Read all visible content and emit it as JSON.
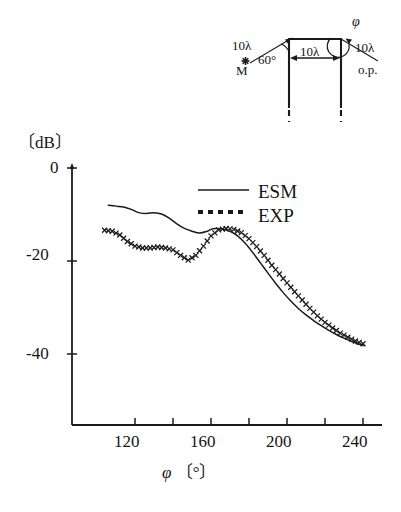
{
  "figure": {
    "y_unit_label": "〔dB〕",
    "x_axis_label_symbol": "φ",
    "x_axis_label_unit": "〔°〕"
  },
  "legend": {
    "esm_label": "ESM",
    "exp_label": "EXP"
  },
  "inset": {
    "source_distance": "10λ",
    "source_marker_label": "M",
    "incidence_angle": "60°",
    "gap_width": "10λ",
    "observation_distance": "10λ",
    "observation_point_label": "o.p.",
    "observation_angle": "φ"
  },
  "chart_data": {
    "type": "line",
    "title": "",
    "xlabel": "φ 〔°〕",
    "ylabel": "〔dB〕",
    "xlim": [
      100,
      250
    ],
    "ylim": [
      -50,
      0
    ],
    "xticks": [
      120,
      160,
      200,
      240
    ],
    "xtick_labels": [
      "120",
      "160",
      "200",
      "240"
    ],
    "xminor_ticks": [
      140,
      180,
      220
    ],
    "yticks": [
      0,
      -20,
      -40
    ],
    "ytick_labels": [
      "0",
      "-20",
      "-40"
    ],
    "grid": false,
    "legend_position": "upper right",
    "series": [
      {
        "name": "ESM",
        "style": "solid-line",
        "color": "#1a1a1a",
        "x": [
          106,
          110,
          114,
          118,
          122,
          126,
          130,
          134,
          138,
          142,
          146,
          150,
          154,
          158,
          160,
          162,
          166,
          170,
          174,
          178,
          182,
          186,
          190,
          194,
          198,
          202,
          206,
          210,
          214,
          218,
          222,
          226,
          230,
          234,
          238,
          240
        ],
        "y": [
          -8.0,
          -8.2,
          -8.4,
          -8.9,
          -9.6,
          -9.8,
          -9.6,
          -9.9,
          -10.8,
          -12.0,
          -13.0,
          -13.6,
          -14.0,
          -13.6,
          -13.2,
          -13.0,
          -13.1,
          -13.6,
          -14.6,
          -16.2,
          -18.2,
          -20.4,
          -22.6,
          -24.8,
          -26.8,
          -28.6,
          -30.2,
          -31.6,
          -32.8,
          -33.9,
          -34.9,
          -35.8,
          -36.6,
          -37.3,
          -37.9,
          -38.2
        ]
      },
      {
        "name": "EXP",
        "style": "cross-markers",
        "color": "#1a1a1a",
        "x": [
          104,
          108,
          112,
          116,
          120,
          124,
          128,
          132,
          136,
          140,
          144,
          148,
          152,
          156,
          160,
          164,
          168,
          172,
          176,
          180,
          184,
          188,
          192,
          196,
          200,
          204,
          208,
          212,
          216,
          220,
          224,
          228,
          232,
          236,
          240
        ],
        "y": [
          -13.4,
          -13.6,
          -14.4,
          -15.8,
          -16.8,
          -17.2,
          -17.2,
          -17.0,
          -17.2,
          -17.6,
          -18.8,
          -19.8,
          -18.8,
          -16.8,
          -14.6,
          -13.3,
          -13.0,
          -13.2,
          -13.9,
          -15.2,
          -16.9,
          -18.8,
          -20.9,
          -22.8,
          -24.7,
          -26.6,
          -28.4,
          -30.2,
          -31.8,
          -33.2,
          -34.4,
          -35.5,
          -36.4,
          -37.2,
          -37.8
        ]
      }
    ]
  }
}
